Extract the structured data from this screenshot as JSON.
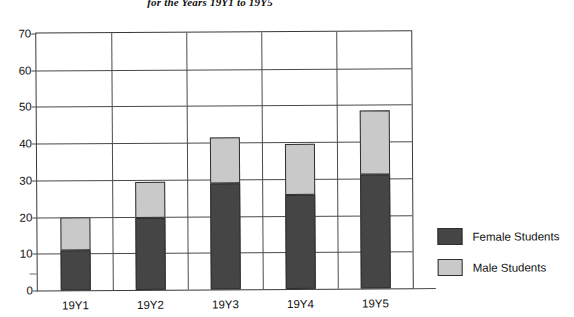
{
  "chart_data": {
    "type": "bar",
    "subtype": "stacked-vertical",
    "title": "for the Years 19Y1 to 19Y5",
    "xlabel": "",
    "ylabel": "",
    "categories": [
      "19Y1",
      "19Y2",
      "19Y3",
      "19Y4",
      "19Y5"
    ],
    "series": [
      {
        "name": "Female Students",
        "color": "#454545",
        "values": [
          11,
          19.5,
          29,
          25.5,
          31
        ]
      },
      {
        "name": "Male Students",
        "color": "#c9c9c9",
        "values": [
          9,
          10,
          12.5,
          14,
          17.5
        ]
      }
    ],
    "totals": [
      20,
      29.5,
      41.5,
      39.5,
      48.5
    ],
    "ylim": [
      0,
      70
    ],
    "yticks": [
      0,
      10,
      20,
      30,
      40,
      50,
      60,
      70
    ],
    "ytick_labels": [
      "0",
      "10",
      "20",
      "30",
      "40",
      "50",
      "60",
      "70"
    ],
    "grid": "horizontal-and-vertical",
    "legend_position": "right"
  },
  "legend": {
    "items": [
      {
        "label": "Female Students",
        "color": "#454545"
      },
      {
        "label": "Male Students",
        "color": "#c9c9c9"
      }
    ]
  },
  "colors": {
    "female": "#454545",
    "male": "#c9c9c9",
    "axis": "#3a3a3a",
    "grid": "#4a4a4a",
    "background": "#ffffff"
  }
}
